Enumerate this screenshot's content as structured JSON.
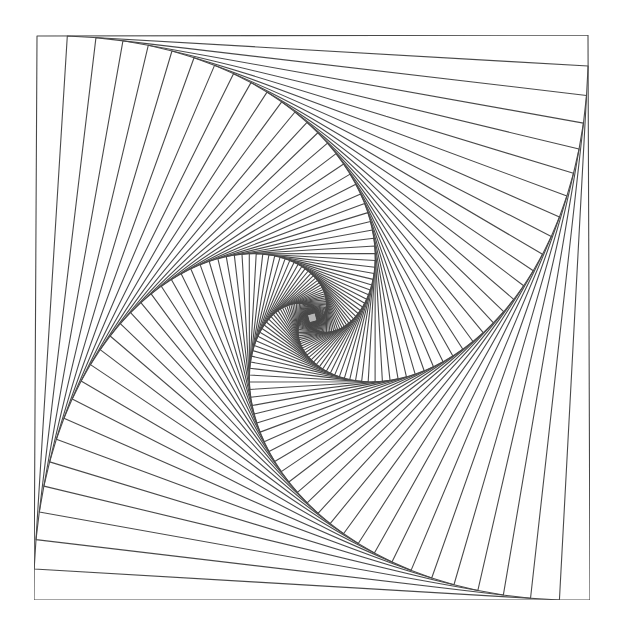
{
  "artwork": {
    "title": "Pencil whirl of nested squares",
    "medium": "pencil on paper",
    "background_color": "#ffffff",
    "stroke_color": "#4a4a4a",
    "shade_color": "#9a9a9a",
    "outer_square": [
      [
        37,
        36
      ],
      [
        588,
        35
      ],
      [
        590,
        600
      ],
      [
        34,
        600
      ]
    ],
    "step_fraction": 0.055,
    "iterations": 78,
    "stroke_width": 1.1
  }
}
